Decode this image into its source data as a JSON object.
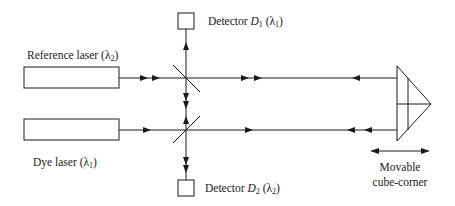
{
  "diagram": {
    "components": {
      "reference_laser": {
        "label": "Reference laser",
        "wavelength_symbol": "λ",
        "wavelength_index": "2"
      },
      "dye_laser": {
        "label": "Dye laser",
        "wavelength_symbol": "λ",
        "wavelength_index": "1"
      },
      "detector_1": {
        "label": "Detector",
        "name_letter": "D",
        "name_index": "1",
        "wavelength_symbol": "λ",
        "wavelength_index": "1"
      },
      "detector_2": {
        "label": "Detector",
        "name_letter": "D",
        "name_index": "2",
        "wavelength_symbol": "λ",
        "wavelength_index": "2"
      },
      "cube_corner": {
        "label_line1": "Movable",
        "label_line2": "cube-corner"
      }
    },
    "punct": {
      "open": " (",
      "close": ")",
      "space": " "
    },
    "colors": {
      "line": "#1a1a1a",
      "background": "#ffffff"
    }
  }
}
